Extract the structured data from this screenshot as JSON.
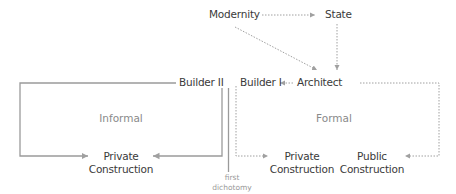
{
  "diagram": {
    "nodes": {
      "modernity": "Modernity",
      "state": "State",
      "architect": "Architect",
      "builder_1": "Builder I",
      "builder_2": "Builder II",
      "private_construction_informal": [
        "Private",
        "Construction"
      ],
      "private_construction_formal": [
        "Private",
        "Construction"
      ],
      "public_construction": [
        "Public",
        "Construction"
      ]
    },
    "regions": {
      "informal": "Informal",
      "formal": "Formal"
    },
    "annotations": {
      "first_dichotomy": [
        "first",
        "dichotomy"
      ]
    },
    "edges": [
      {
        "from": "Modernity",
        "to": "State",
        "style": "dotted"
      },
      {
        "from": "Modernity",
        "to": "Architect",
        "style": "dotted"
      },
      {
        "from": "State",
        "to": "Architect",
        "style": "dotted"
      },
      {
        "from": "Architect",
        "to": "Builder I",
        "style": "dotted"
      },
      {
        "from": "Builder I",
        "to": "Private Construction (formal)",
        "style": "dotted"
      },
      {
        "from": "Architect",
        "to": "Public Construction",
        "style": "dotted"
      },
      {
        "from": "Builder II",
        "to": "Private Construction (informal)",
        "style": "solid"
      }
    ],
    "colors": {
      "text": "#3a3a3a",
      "region_text": "#8a8a8a",
      "line": "#9a9a9a"
    }
  }
}
